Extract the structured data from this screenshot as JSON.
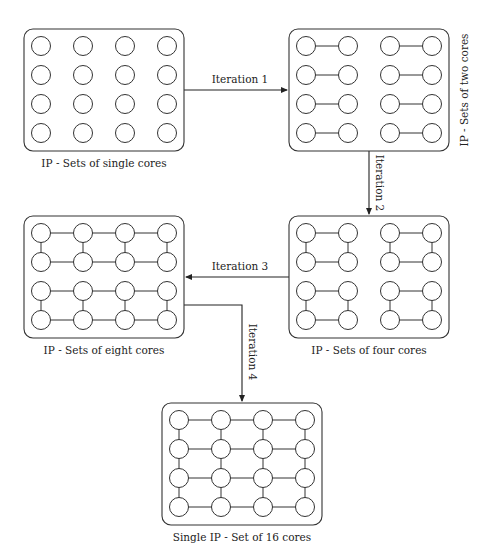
{
  "colors": {
    "stroke": "#333333",
    "text": "#222222",
    "background": "#ffffff"
  },
  "stages": [
    {
      "id": "single",
      "caption": "IP - Sets of single cores",
      "box": [
        24,
        29,
        160,
        122
      ],
      "caption_pos": [
        104,
        167
      ],
      "caption_rotated": false,
      "groupings": "none"
    },
    {
      "id": "two",
      "caption": "IP - Sets of two cores",
      "box": [
        289,
        29,
        160,
        122
      ],
      "caption_pos": [
        468,
        90
      ],
      "caption_rotated": true,
      "groupings": "pairs"
    },
    {
      "id": "four",
      "caption": "IP - Sets of four cores",
      "box": [
        289,
        216,
        160,
        122
      ],
      "caption_pos": [
        369,
        354
      ],
      "caption_rotated": false,
      "groupings": "quads"
    },
    {
      "id": "eight",
      "caption": "IP - Sets of eight cores",
      "box": [
        24,
        216,
        160,
        122
      ],
      "caption_pos": [
        104,
        354
      ],
      "caption_rotated": false,
      "groupings": "octets"
    },
    {
      "id": "sixteen",
      "caption": "Single IP - Set of 16 cores",
      "box": [
        162,
        403,
        160,
        122
      ],
      "caption_pos": [
        242,
        541
      ],
      "caption_rotated": false,
      "groupings": "full"
    }
  ],
  "arrows": [
    {
      "label": "Iteration 1",
      "path": [
        [
          184,
          90
        ],
        [
          287,
          90
        ]
      ],
      "label_pos": [
        240,
        83
      ],
      "label_rotated": false
    },
    {
      "label": "Iteration 2",
      "path": [
        [
          369,
          151
        ],
        [
          369,
          214
        ]
      ],
      "label_pos": [
        376,
        183
      ],
      "label_rotated": true
    },
    {
      "label": "Iteration 3",
      "path": [
        [
          289,
          277
        ],
        [
          186,
          277
        ]
      ],
      "label_pos": [
        240,
        270
      ],
      "label_rotated": false
    },
    {
      "label": "Iteration 4",
      "path": [
        [
          184,
          305
        ],
        [
          242,
          305
        ],
        [
          242,
          401
        ]
      ],
      "label_pos": [
        249,
        352
      ],
      "label_rotated": true
    }
  ],
  "grid": {
    "rows": 4,
    "cols": 4,
    "col_offsets": [
      17,
      59,
      101,
      143
    ],
    "row_offsets": [
      17,
      46,
      75,
      104
    ],
    "radius": 9.5
  }
}
